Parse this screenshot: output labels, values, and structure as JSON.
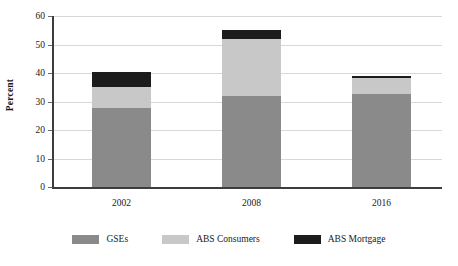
{
  "chart_data": {
    "type": "bar",
    "subtype": "stacked-bar",
    "title": "",
    "xlabel": "",
    "ylabel": "Percent",
    "categories": [
      "2002",
      "2008",
      "2016"
    ],
    "series": [
      {
        "name": "GSEs",
        "values": [
          27.8,
          32.0,
          32.5
        ],
        "color": "#8a8a8a"
      },
      {
        "name": "ABS Consumers",
        "values": [
          7.4,
          20.0,
          5.8
        ],
        "color": "#c8c8c8"
      },
      {
        "name": "ABS Mortgage",
        "values": [
          5.3,
          3.0,
          0.7
        ],
        "color": "#1c1c1c"
      }
    ],
    "totals": [
      40.5,
      55.0,
      39.0
    ],
    "ylim": [
      0,
      60
    ],
    "ytick_step": 10,
    "yticks": [
      "60",
      "50",
      "40",
      "30",
      "20",
      "10",
      "0"
    ],
    "grid": "horizontal",
    "legend_position": "bottom",
    "axis_color": "#3d3d3d",
    "gridline_color": "#d8d8d8",
    "background": "#ffffff"
  },
  "legend": {
    "items": [
      {
        "label": "GSEs",
        "color": "#8a8a8a"
      },
      {
        "label": "ABS Consumers",
        "color": "#c8c8c8"
      },
      {
        "label": "ABS Mortgage",
        "color": "#1c1c1c"
      }
    ]
  }
}
